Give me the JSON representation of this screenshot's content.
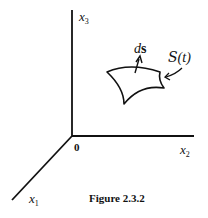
{
  "figure": {
    "caption": "Figure 2.3.2",
    "origin_label": "0",
    "axes": [
      {
        "name": "x",
        "sub": "1"
      },
      {
        "name": "x",
        "sub": "2"
      },
      {
        "name": "x",
        "sub": "3"
      }
    ],
    "surface_label": "𝒮(t)",
    "surface_label_script": "S",
    "surface_label_arg": "(t)",
    "normal_label_d": "d",
    "normal_label_s": "s"
  }
}
